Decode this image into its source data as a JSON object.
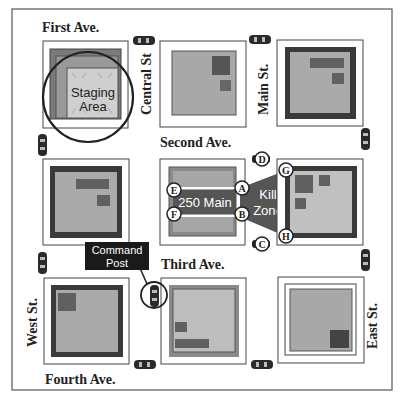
{
  "streets": {
    "first_ave": "First Ave.",
    "second_ave": "Second Ave.",
    "third_ave": "Third Ave.",
    "fourth_ave": "Fourth Ave.",
    "central_st": "Central St",
    "main_st": "Main St.",
    "west_st": "West St.",
    "east_st": "East St."
  },
  "labels": {
    "staging_area_line1": "Staging",
    "staging_area_line2": "Area",
    "building": "250 Main",
    "kill_zone_line1": "Kill",
    "kill_zone_line2": "Zone",
    "command_post_line1": "Command",
    "command_post_line2": "Post"
  },
  "points": {
    "a": "A",
    "b": "B",
    "c": "C",
    "d": "D",
    "e": "E",
    "f": "F",
    "g": "G",
    "h": "H"
  },
  "colors": {
    "block_fill": "#a8a8a8",
    "block_dark": "#4a4a4a",
    "building_dark": "#5a5a5a",
    "kill_zone": "#555555",
    "staging_fill": "#c8c8c8"
  }
}
